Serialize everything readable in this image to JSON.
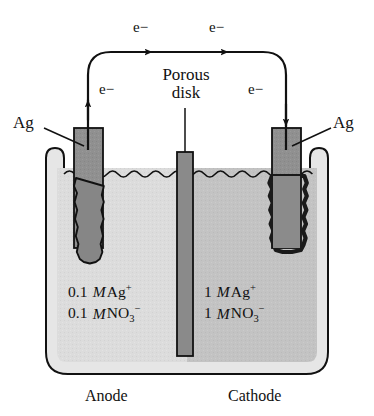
{
  "figure": {
    "type": "electrochemical-concentration-cell"
  },
  "electron_labels": [
    {
      "id": "e-anode",
      "text": "e−"
    },
    {
      "id": "e-top-left",
      "text": "e−"
    },
    {
      "id": "e-top-right",
      "text": "e−"
    },
    {
      "id": "e-cathode",
      "text": "e−"
    }
  ],
  "electrode_labels": {
    "left": "Ag",
    "right": "Ag"
  },
  "divider": {
    "line1": "Porous",
    "line2": "disk"
  },
  "solutions": {
    "left": {
      "cation_conc": "0.1",
      "cation_unit": "M",
      "cation": "Ag",
      "cation_charge": "+",
      "anion_conc": "0.1",
      "anion_unit": "M",
      "anion": "NO",
      "anion_sub": "3",
      "anion_charge": "−",
      "fill_color": "#dcdcdc"
    },
    "right": {
      "cation_conc": "1",
      "cation_unit": "M",
      "cation": "Ag",
      "cation_charge": "+",
      "anion_conc": "1",
      "anion_unit": "M",
      "anion": "NO",
      "anion_sub": "3",
      "anion_charge": "−",
      "fill_color": "#c3c3c3"
    }
  },
  "footer": {
    "left": "Anode",
    "right": "Cathode"
  },
  "colors": {
    "stroke": "#111111",
    "electrode": "#8f8f8f",
    "electrode_dark": "#7d7d7d",
    "disk": "#8a8a8a",
    "vessel_wall": "#e4e4e4",
    "background": "#ffffff"
  }
}
